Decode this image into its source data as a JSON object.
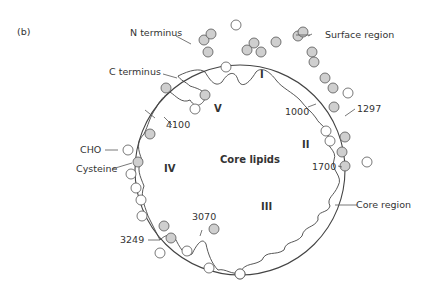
{
  "figure": {
    "panel_label": "(b)",
    "center_label": "Core lipids",
    "domains": [
      "I",
      "II",
      "III",
      "IV",
      "V"
    ],
    "annotations": {
      "n_terminus": "N terminus",
      "c_terminus": "C terminus",
      "surface_region": "Surface region",
      "core_region": "Core region",
      "cho": "CHO",
      "cysteine": "Cysteine"
    },
    "residue_markers": [
      "1000",
      "1297",
      "1700",
      "3070",
      "3249",
      "4100"
    ],
    "colors": {
      "line": "#444444",
      "cysteine_fill": "#cfcfcf",
      "cho_fill": "#ffffff",
      "text": "#333333"
    }
  }
}
